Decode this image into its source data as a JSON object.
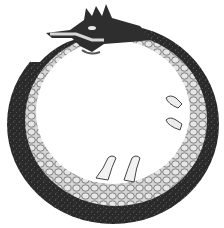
{
  "image": {
    "subject": "Ouroboros",
    "description": "Engraved illustration of a dragon-like serpent forming a ring and biting its own tail",
    "colors": {
      "background": "#ffffff",
      "dark_band": "#2e2e2e",
      "scales_light": "#cfcfcf",
      "scale_outline": "#6a6a6a",
      "ink": "#1e1e1e"
    }
  }
}
